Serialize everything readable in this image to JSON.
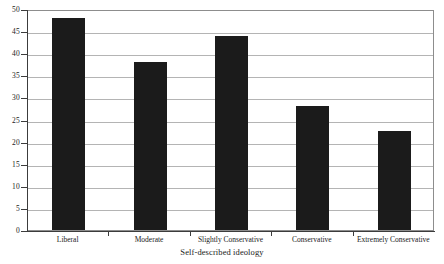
{
  "chart_data": {
    "type": "bar",
    "title": "",
    "xlabel": "Self-described ideology",
    "ylabel": "",
    "categories": [
      "Liberal",
      "Moderate",
      "Slightly Conservative",
      "Conservative",
      "Extremely Conservative"
    ],
    "values": [
      48,
      38,
      44,
      28,
      22.5
    ],
    "ylim": [
      0,
      50
    ],
    "yticks": [
      0,
      5,
      10,
      15,
      20,
      25,
      30,
      35,
      40,
      45,
      50
    ],
    "ytick_labels": [
      "0",
      "5",
      "10",
      "15",
      "20",
      "25",
      "30",
      "35",
      "40",
      "45",
      "50"
    ],
    "grid": true,
    "legend": false,
    "bar_color": "#1b1b1b",
    "gridline_color": "#b4b4b4",
    "axis_color": "#3c3c3c",
    "background_color": "#ffffff"
  },
  "axis": {
    "x_title": "Self-described ideology"
  }
}
